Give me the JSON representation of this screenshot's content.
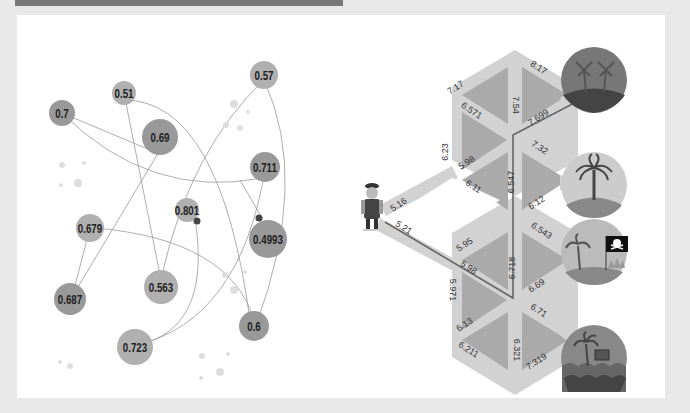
{
  "left_graph": {
    "nodes": [
      {
        "id": "n1",
        "label": "0.7",
        "x": 62,
        "y": 113,
        "r": 13
      },
      {
        "id": "n2",
        "label": "0.51",
        "x": 124,
        "y": 93,
        "r": 12
      },
      {
        "id": "n3",
        "label": "0.69",
        "x": 160,
        "y": 137,
        "r": 18
      },
      {
        "id": "n4",
        "label": "0.57",
        "x": 264,
        "y": 75,
        "r": 14
      },
      {
        "id": "n5",
        "label": "0.711",
        "x": 265,
        "y": 167,
        "r": 15
      },
      {
        "id": "n6",
        "label": "0.801",
        "x": 187,
        "y": 210,
        "r": 12
      },
      {
        "id": "n7",
        "label": "0.4993",
        "x": 268,
        "y": 239,
        "r": 19
      },
      {
        "id": "n8",
        "label": "0.679",
        "x": 90,
        "y": 228,
        "r": 14
      },
      {
        "id": "n9",
        "label": "0.563",
        "x": 161,
        "y": 287,
        "r": 17
      },
      {
        "id": "n10",
        "label": "0.687",
        "x": 70,
        "y": 299,
        "r": 16
      },
      {
        "id": "n11",
        "label": "0.723",
        "x": 135,
        "y": 347,
        "r": 18
      },
      {
        "id": "n12",
        "label": "0.6",
        "x": 254,
        "y": 326,
        "r": 15
      }
    ]
  },
  "right_graph": {
    "character": "pirate",
    "edge_labels": [
      {
        "text": "7.17",
        "x": 457,
        "y": 90,
        "rot": -33
      },
      {
        "text": "8.17",
        "x": 537,
        "y": 70,
        "rot": 33
      },
      {
        "text": "6.571",
        "x": 470,
        "y": 113,
        "rot": 33
      },
      {
        "text": "7.54",
        "x": 513,
        "y": 105,
        "rot": 90
      },
      {
        "text": "7.699",
        "x": 540,
        "y": 120,
        "rot": -33
      },
      {
        "text": "6.23",
        "x": 448,
        "y": 152,
        "rot": -90
      },
      {
        "text": "7.32",
        "x": 538,
        "y": 150,
        "rot": 33
      },
      {
        "text": "5.98",
        "x": 468,
        "y": 165,
        "rot": -33
      },
      {
        "text": "6.11",
        "x": 472,
        "y": 189,
        "rot": 33
      },
      {
        "text": "6.547",
        "x": 514,
        "y": 182,
        "rot": -90
      },
      {
        "text": "6.12",
        "x": 538,
        "y": 205,
        "rot": -33
      },
      {
        "text": "5.16",
        "x": 400,
        "y": 207,
        "rot": -33
      },
      {
        "text": "5.21",
        "x": 402,
        "y": 230,
        "rot": 33
      },
      {
        "text": "6.543",
        "x": 540,
        "y": 233,
        "rot": 33
      },
      {
        "text": "5.95",
        "x": 466,
        "y": 247,
        "rot": -33
      },
      {
        "text": "5.98",
        "x": 467,
        "y": 270,
        "rot": 33
      },
      {
        "text": "6.718",
        "x": 515,
        "y": 268,
        "rot": -90
      },
      {
        "text": "6.69",
        "x": 538,
        "y": 288,
        "rot": -33
      },
      {
        "text": "5.971",
        "x": 450,
        "y": 290,
        "rot": 90
      },
      {
        "text": "6.71",
        "x": 537,
        "y": 313,
        "rot": 33
      },
      {
        "text": "6.13",
        "x": 466,
        "y": 327,
        "rot": -33
      },
      {
        "text": "6.211",
        "x": 467,
        "y": 352,
        "rot": 33
      },
      {
        "text": "6.321",
        "x": 514,
        "y": 350,
        "rot": 90
      },
      {
        "text": "7.319",
        "x": 538,
        "y": 364,
        "rot": -33
      }
    ],
    "destinations": [
      {
        "name": "palm-island-dark",
        "x": 594,
        "y": 80
      },
      {
        "name": "palm-island",
        "x": 594,
        "y": 185
      },
      {
        "name": "pirate-flag-island",
        "x": 594,
        "y": 252
      },
      {
        "name": "treasure-island",
        "x": 594,
        "y": 358
      }
    ]
  }
}
